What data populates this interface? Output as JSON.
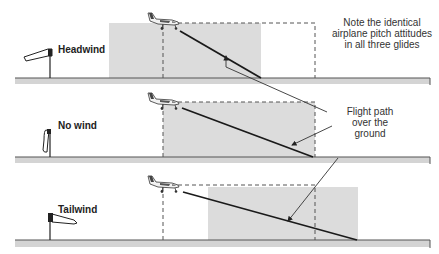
{
  "figure": {
    "colors": {
      "background": "#ffffff",
      "ground_fill": "#d4d4d4",
      "ground_line": "#666666",
      "shaded_area": "#dcdcdc",
      "flight_path": "#1a1a1a",
      "dashed_box": "#555555",
      "leader_line": "#333333"
    },
    "note": {
      "line1": "Note the identical",
      "line2": "airplane pitch attitudes",
      "line3": "in all three glides"
    },
    "callout": {
      "line1": "Flight path",
      "line2": "over the",
      "line3": "ground"
    },
    "panels": [
      {
        "label": "Headwind",
        "windsock": "windsock-headwind-icon"
      },
      {
        "label": "No wind",
        "windsock": "windsock-calm-icon"
      },
      {
        "label": "Tailwind",
        "windsock": "windsock-tailwind-icon"
      }
    ]
  }
}
